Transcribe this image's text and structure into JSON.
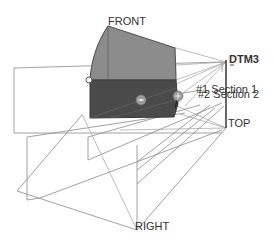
{
  "viewport": {
    "background": "#ffffff",
    "labels": {
      "front": "FRONT",
      "top": "TOP",
      "right": "RIGHT",
      "datum": "DTM3",
      "section1": "#1 Section 1",
      "section2": "#2 Section 2"
    },
    "colors": {
      "solid_light": "#8c8c8c",
      "solid_dark": "#4a4a4a",
      "edge": "#5a5a5a",
      "datum_plane_line": "#7a7a7a",
      "datum_axis": "#2a2a2a",
      "label_text": "#333333"
    }
  }
}
